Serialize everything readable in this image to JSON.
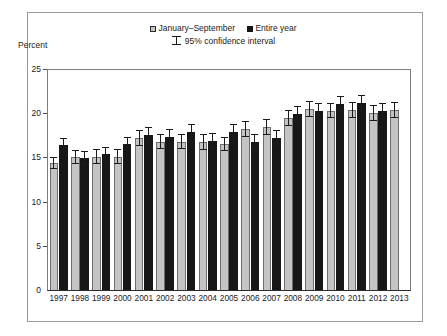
{
  "figure": {
    "y_axis_title": "Percent"
  },
  "legend": {
    "items": [
      {
        "label": "January–September",
        "style": "light",
        "color": "#c4c4c4"
      },
      {
        "label": "Entire year",
        "style": "dark",
        "color": "#171717"
      }
    ],
    "ci_label": "95% confidence interval"
  },
  "chart_data": {
    "type": "bar",
    "title": "",
    "subtitle": "",
    "xlabel": "",
    "ylabel": "Percent",
    "ylim": [
      0,
      25
    ],
    "yticks": [
      0,
      5,
      10,
      15,
      20,
      25
    ],
    "grid": false,
    "legend_position": "top-center",
    "annotations": [
      "95% confidence interval"
    ],
    "categories": [
      "1997",
      "1998",
      "1999",
      "2000",
      "2001",
      "2002",
      "2003",
      "2004",
      "2005",
      "2006",
      "2007",
      "2008",
      "2009",
      "2010",
      "2011",
      "2012",
      "2013"
    ],
    "series": [
      {
        "name": "January–September",
        "color": "#c4c4c4",
        "values": [
          14.4,
          15.0,
          15.1,
          15.1,
          17.2,
          16.8,
          16.8,
          16.7,
          16.5,
          18.2,
          18.4,
          19.5,
          20.5,
          20.3,
          20.4,
          20.0,
          20.4
        ],
        "ci_low": [
          13.7,
          14.2,
          14.3,
          14.3,
          16.3,
          15.9,
          15.9,
          15.8,
          15.7,
          17.3,
          17.5,
          18.6,
          19.6,
          19.4,
          19.5,
          19.1,
          19.5
        ],
        "ci_high": [
          15.1,
          15.8,
          15.9,
          15.9,
          18.1,
          17.7,
          17.7,
          17.6,
          17.3,
          19.1,
          19.3,
          20.4,
          21.4,
          21.2,
          21.3,
          20.9,
          21.3
        ]
      },
      {
        "name": "Entire year",
        "color": "#171717",
        "values": [
          16.4,
          14.9,
          15.4,
          16.5,
          17.5,
          17.3,
          17.9,
          16.9,
          17.9,
          16.7,
          17.2,
          19.9,
          20.2,
          21.0,
          21.2,
          20.2,
          null
        ],
        "ci_low": [
          15.6,
          14.1,
          14.6,
          15.7,
          16.6,
          16.4,
          17.0,
          16.0,
          17.0,
          15.8,
          16.3,
          19.0,
          19.3,
          20.1,
          20.3,
          19.3,
          null
        ],
        "ci_high": [
          17.2,
          15.7,
          16.2,
          17.3,
          18.4,
          18.2,
          18.8,
          17.8,
          18.8,
          17.6,
          18.1,
          20.8,
          21.1,
          21.9,
          22.1,
          21.1,
          null
        ]
      }
    ]
  }
}
